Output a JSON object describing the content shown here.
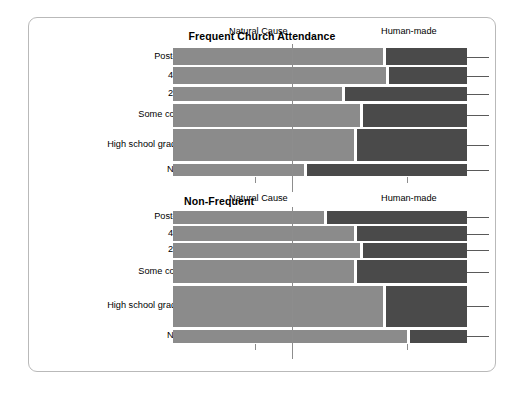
{
  "figure": {
    "background": "#ffffff",
    "frame_border_color": "#b9b9b9",
    "color_natural": "#8b8b8b",
    "color_human": "#4a4a4a"
  },
  "chart_data": {
    "type": "bar",
    "orientation": "horizontal",
    "stacked": true,
    "normalized": true,
    "title": "",
    "xlabel": "",
    "ylabel": "",
    "grid": false,
    "legend_position": "below-axis-as-labels",
    "axis_labels": [
      "Natural Cause",
      "Human-made"
    ],
    "categories": [
      "Post-grad",
      "4-year",
      "2-year",
      "Some college",
      "High school graduate",
      "No HS"
    ],
    "series": [
      {
        "name": "Natural Cause",
        "color": "#8b8b8b"
      },
      {
        "name": "Human-made",
        "color": "#4a4a4a"
      }
    ],
    "panels": [
      {
        "title": "Frequent Church Attendance",
        "categories": [
          "Post-grad",
          "4-year",
          "2-year",
          "Some college",
          "High school graduate",
          "No HS"
        ],
        "row_weights": [
          1.0,
          1.0,
          0.85,
          1.35,
          1.9,
          0.72
        ],
        "rows": [
          {
            "category": "Post-grad",
            "natural": 72,
            "human": 28
          },
          {
            "category": "4-year",
            "natural": 73,
            "human": 27
          },
          {
            "category": "2-year",
            "natural": 58,
            "human": 42
          },
          {
            "category": "Some college",
            "natural": 64,
            "human": 36
          },
          {
            "category": "High school graduate",
            "natural": 62,
            "human": 38
          },
          {
            "category": "No HS",
            "natural": 45,
            "human": 55
          }
        ]
      },
      {
        "title": "Non-Frequent",
        "categories": [
          "Post-grad",
          "4-year",
          "2-year",
          "Some college",
          "High school graduate",
          "No HS"
        ],
        "row_weights": [
          0.72,
          0.8,
          0.8,
          1.3,
          2.3,
          0.75
        ],
        "rows": [
          {
            "category": "Post-grad",
            "natural": 52,
            "human": 48
          },
          {
            "category": "4-year",
            "natural": 62,
            "human": 38
          },
          {
            "category": "2-year",
            "natural": 64,
            "human": 36
          },
          {
            "category": "Some college",
            "natural": 62,
            "human": 38
          },
          {
            "category": "High school graduate",
            "natural": 72,
            "human": 28
          },
          {
            "category": "No HS",
            "natural": 80,
            "human": 20
          }
        ]
      }
    ]
  }
}
